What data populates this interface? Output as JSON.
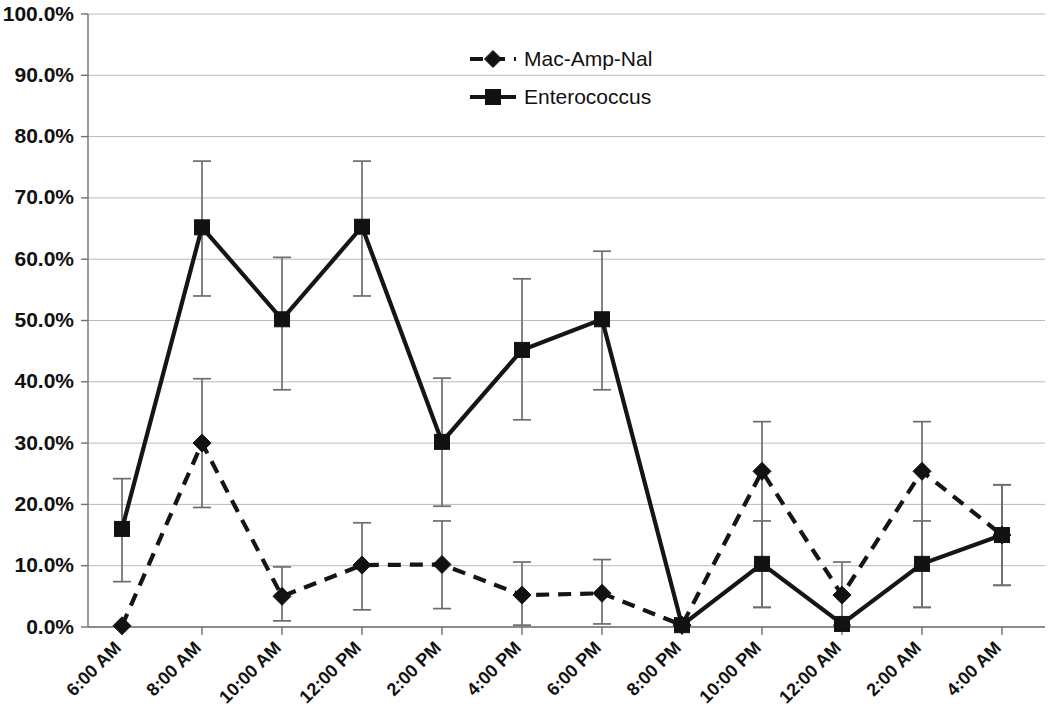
{
  "chart_data": {
    "type": "line",
    "title": "",
    "subtitle": "",
    "xlabel": "",
    "ylabel": "",
    "ylim": [
      0,
      100
    ],
    "y_tick_labels": [
      "0.0%",
      "10.0%",
      "20.0%",
      "30.0%",
      "40.0%",
      "50.0%",
      "60.0%",
      "70.0%",
      "80.0%",
      "90.0%",
      "100.0%"
    ],
    "y_ticks": [
      0,
      10,
      20,
      30,
      40,
      50,
      60,
      70,
      80,
      90,
      100
    ],
    "grid": true,
    "grid_axis": "y",
    "legend_position": "top-center",
    "categories": [
      "6:00 AM",
      "8:00 AM",
      "10:00 AM",
      "12:00 PM",
      "2:00 PM",
      "4:00 PM",
      "6:00 PM",
      "8:00 PM",
      "10:00 PM",
      "12:00 AM",
      "2:00 AM",
      "4:00 AM"
    ],
    "series": [
      {
        "name": "Mac-Amp-Nal",
        "marker": "diamond",
        "linestyle": "dashed",
        "color": "#121212",
        "values": [
          0.2,
          30.0,
          5.0,
          10.1,
          10.2,
          5.2,
          5.5,
          0.3,
          25.4,
          5.2,
          25.4,
          15.0
        ],
        "err_low": [
          0.2,
          19.5,
          1.0,
          2.8,
          3.0,
          0.3,
          0.5,
          0.3,
          3.2,
          0.3,
          3.2,
          6.8
        ],
        "err_high": [
          0.2,
          40.5,
          9.8,
          17.0,
          17.3,
          10.6,
          11.0,
          0.3,
          33.5,
          10.6,
          33.5,
          23.2
        ]
      },
      {
        "name": "Enterococcus",
        "marker": "square",
        "linestyle": "solid",
        "color": "#121212",
        "values": [
          16.0,
          65.2,
          50.2,
          65.3,
          30.2,
          45.2,
          50.2,
          0.3,
          10.3,
          0.5,
          10.3,
          15.0
        ],
        "err_low": [
          7.4,
          54.0,
          38.7,
          54.0,
          19.7,
          33.8,
          38.7,
          0.3,
          3.2,
          0.5,
          3.2,
          6.8
        ],
        "err_high": [
          24.2,
          76.0,
          60.3,
          76.0,
          40.6,
          56.8,
          61.3,
          0.3,
          17.3,
          0.5,
          17.3,
          23.2
        ]
      }
    ],
    "legend": [
      {
        "label": "Mac-Amp-Nal",
        "marker": "diamond",
        "linestyle": "dashed"
      },
      {
        "label": "Enterococcus",
        "marker": "square",
        "linestyle": "solid"
      }
    ]
  }
}
